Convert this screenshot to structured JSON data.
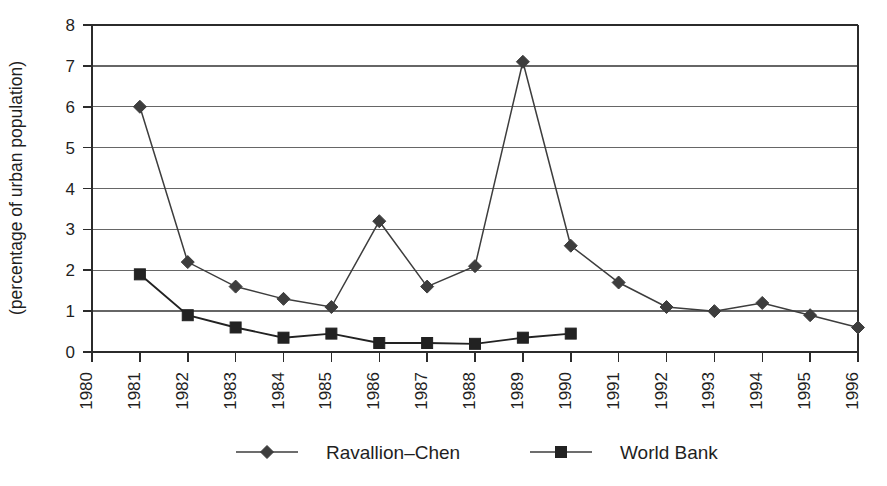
{
  "chart_data": {
    "type": "line",
    "title": "",
    "xlabel": "",
    "ylabel": "(percentage of urban population)",
    "ylim": [
      0,
      8
    ],
    "yticks": [
      "0",
      "1",
      "2",
      "3",
      "4",
      "5",
      "6",
      "7",
      "8"
    ],
    "grid": true,
    "legend_position": "bottom",
    "categories": [
      "1980",
      "1981",
      "1982",
      "1983",
      "1984",
      "1985",
      "1986",
      "1987",
      "1988",
      "1989",
      "1990",
      "1991",
      "1992",
      "1993",
      "1994",
      "1995",
      "1996"
    ],
    "series": [
      {
        "name": "Ravallion–Chen",
        "marker": "diamond",
        "color": "#3d3d3d",
        "values": [
          null,
          6.0,
          2.2,
          1.6,
          1.3,
          1.1,
          3.2,
          1.6,
          2.1,
          7.1,
          2.6,
          1.7,
          1.1,
          1.0,
          1.2,
          0.9,
          0.6
        ]
      },
      {
        "name": "World Bank",
        "marker": "square",
        "color": "#222222",
        "values": [
          null,
          1.9,
          0.9,
          0.6,
          0.35,
          0.45,
          0.22,
          0.22,
          0.2,
          0.35,
          0.45,
          null,
          null,
          null,
          null,
          null,
          null
        ]
      }
    ]
  },
  "legend": {
    "items": [
      {
        "label": "Ravallion–Chen",
        "marker": "diamond"
      },
      {
        "label": "World Bank",
        "marker": "square"
      }
    ]
  }
}
